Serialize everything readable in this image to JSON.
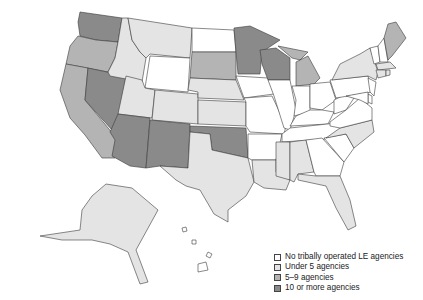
{
  "map": {
    "type": "choropleth",
    "region": "United States",
    "subject": "Tribally operated law enforcement (LE) agencies by state",
    "colors": {
      "none": "#ffffff",
      "under5": "#e4e4e4",
      "5to9": "#b4b4b4",
      "10plus": "#8a8a8a"
    },
    "states": {
      "WA": "10plus",
      "OR": "5to9",
      "CA": "5to9",
      "NV": "10plus",
      "ID": "under5",
      "MT": "under5",
      "WY": "none",
      "UT": "under5",
      "AZ": "10plus",
      "NM": "10plus",
      "CO": "under5",
      "ND": "none",
      "SD": "5to9",
      "NE": "under5",
      "KS": "under5",
      "OK": "10plus",
      "TX": "under5",
      "MN": "10plus",
      "IA": "none",
      "MO": "none",
      "AR": "none",
      "LA": "under5",
      "WI": "10plus",
      "IL": "none",
      "MI": "5to9",
      "IN": "none",
      "OH": "none",
      "KY": "none",
      "TN": "none",
      "MS": "under5",
      "AL": "under5",
      "GA": "none",
      "FL": "under5",
      "SC": "none",
      "NC": "under5",
      "VA": "none",
      "WV": "none",
      "PA": "none",
      "NY": "under5",
      "VT": "none",
      "NH": "none",
      "ME": "5to9",
      "MA": "under5",
      "RI": "under5",
      "CT": "under5",
      "NJ": "none",
      "DE": "none",
      "MD": "none",
      "AK": "under5",
      "HI": "none"
    }
  },
  "legend": {
    "items": [
      {
        "key": "none",
        "label": "No tribally operated LE agencies",
        "color": "#ffffff"
      },
      {
        "key": "under5",
        "label": "Under 5 agencies",
        "color": "#e4e4e4"
      },
      {
        "key": "5to9",
        "label": "5–9 agencies",
        "color": "#b4b4b4"
      },
      {
        "key": "10plus",
        "label": "10 or more agencies",
        "color": "#8a8a8a"
      }
    ]
  }
}
